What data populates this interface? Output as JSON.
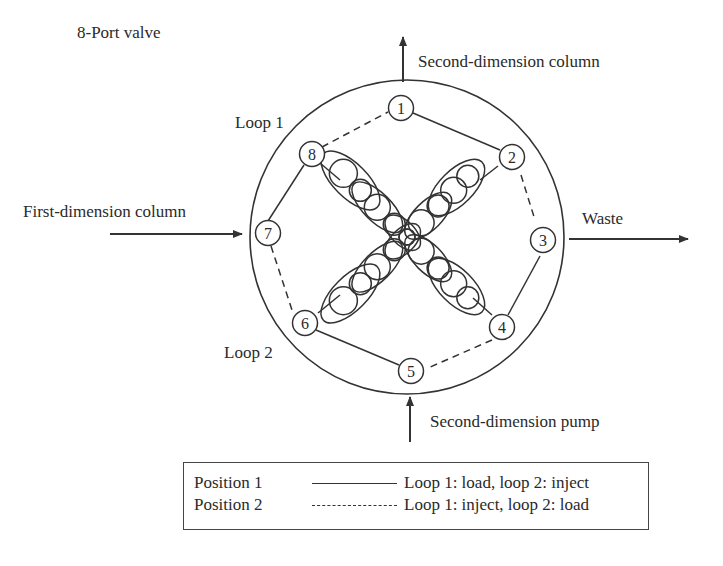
{
  "title": "8-Port valve",
  "labels": {
    "top_outlet": "Second-dimension column",
    "left_inlet": "First-dimension column",
    "right_outlet": "Waste",
    "bottom_inlet": "Second-dimension pump",
    "loop1": "Loop 1",
    "loop2": "Loop 2"
  },
  "ports": [
    {
      "id": 1,
      "label": "1"
    },
    {
      "id": 2,
      "label": "2"
    },
    {
      "id": 3,
      "label": "3"
    },
    {
      "id": 4,
      "label": "4"
    },
    {
      "id": 5,
      "label": "5"
    },
    {
      "id": 6,
      "label": "6"
    },
    {
      "id": 7,
      "label": "7"
    },
    {
      "id": 8,
      "label": "8"
    }
  ],
  "connections": {
    "position1_solid": [
      [
        1,
        2
      ],
      [
        3,
        4
      ],
      [
        5,
        6
      ],
      [
        7,
        8
      ],
      [
        8,
        4
      ],
      [
        2,
        6
      ]
    ],
    "position2_dashed": [
      [
        8,
        1
      ],
      [
        2,
        3
      ],
      [
        4,
        5
      ],
      [
        6,
        7
      ]
    ]
  },
  "legend": {
    "rows": [
      {
        "name": "Position 1",
        "style": "solid",
        "description": "Loop 1: load, loop 2: inject"
      },
      {
        "name": "Position 2",
        "style": "dashed",
        "description": "Loop 1: inject, loop 2: load"
      }
    ]
  },
  "colors": {
    "stroke": "#333333",
    "text": "#2a2a2a",
    "background": "#ffffff"
  }
}
